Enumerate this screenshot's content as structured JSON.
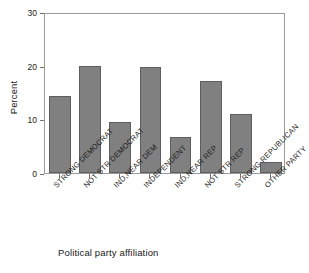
{
  "chart_data": {
    "type": "bar",
    "title": "",
    "xlabel": "Political party affiliation",
    "ylabel": "Percent",
    "ylim": [
      0,
      30
    ],
    "yticks": [
      0,
      10,
      20,
      30
    ],
    "grid": false,
    "legend": "none",
    "categories": [
      "STRONG DEMOCRAT",
      "NOT STR DEMOCRAT",
      "IND,NEAR DEM",
      "INDEPENDENT",
      "IND,NEAR REP",
      "NOT STR REP",
      "STRONG REPUBLICAN",
      "OTHER PARTY"
    ],
    "values": [
      14.4,
      19.9,
      9.5,
      19.8,
      6.7,
      17.2,
      11.0,
      2.1
    ],
    "bar_color": "#808080",
    "bar_edge_color": "#5e5e5e",
    "axis_color": "#9a9a9a",
    "text_color": "#1a1a1a"
  }
}
